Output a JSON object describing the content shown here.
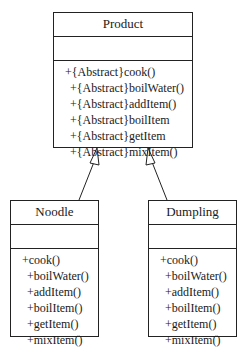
{
  "classes": {
    "product": {
      "name": "Product",
      "attributes": [],
      "operations": [
        "+{Abstract}cook()",
        "+{Abstract}boilWater()",
        "+{Abstract}addItem()",
        "+{Abstract}boilItem",
        "+{Abstract}getItem",
        "+{Abstract}mixItem()"
      ]
    },
    "noodle": {
      "name": "Noodle",
      "attributes": [],
      "operations": [
        "+cook()",
        "+boilWater()",
        "+addItem()",
        "+boilItem()",
        "+getItem()",
        "+mixItem()"
      ]
    },
    "dumpling": {
      "name": "Dumpling",
      "attributes": [],
      "operations": [
        "+cook()",
        "+boilWater()",
        "+addItem()",
        "+boilItem()",
        "+getItem()",
        "+mixItem()"
      ]
    }
  },
  "relations": [
    {
      "type": "generalization",
      "from": "Noodle",
      "to": "Product"
    },
    {
      "type": "generalization",
      "from": "Dumpling",
      "to": "Product"
    }
  ]
}
